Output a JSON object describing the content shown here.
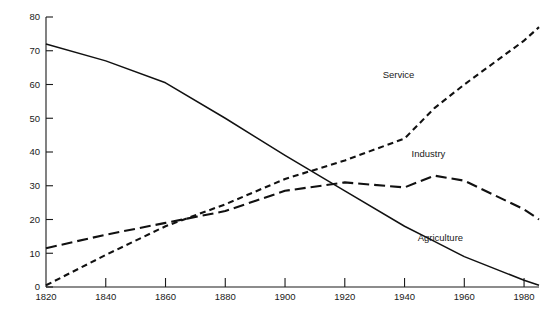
{
  "chart_data": {
    "type": "line",
    "title": "",
    "subtitle": "",
    "xlabel": "",
    "ylabel": "",
    "xlim": [
      1820,
      1985
    ],
    "ylim": [
      0,
      80
    ],
    "grid": false,
    "legend_position": "inline-annotations",
    "x_ticks": [
      "1820",
      "1840",
      "1860",
      "1880",
      "1900",
      "1920",
      "1940",
      "1960",
      "1980"
    ],
    "x_tick_values": [
      1820,
      1840,
      1860,
      1880,
      1900,
      1920,
      1940,
      1960,
      1980
    ],
    "y_ticks": [
      "0",
      "10",
      "20",
      "30",
      "40",
      "50",
      "60",
      "70",
      "80"
    ],
    "y_tick_values": [
      0,
      10,
      20,
      30,
      40,
      50,
      60,
      70,
      80
    ],
    "x": [
      1820,
      1840,
      1860,
      1880,
      1900,
      1920,
      1940,
      1950,
      1960,
      1980,
      1985
    ],
    "series": [
      {
        "name": "Agriculture",
        "style": "solid",
        "color": "#111111",
        "label_x": 1952,
        "label_y": 13.5,
        "values": [
          72,
          67,
          60.5,
          50,
          39,
          28.5,
          18,
          13.5,
          9,
          2,
          0.5
        ]
      },
      {
        "name": "Industry",
        "style": "long-dash",
        "color": "#111111",
        "label_x": 1948,
        "label_y": 38.5,
        "values": [
          11.5,
          15.5,
          19,
          22.5,
          28.5,
          31,
          29.5,
          33,
          31.5,
          23,
          20
        ]
      },
      {
        "name": "Service",
        "style": "short-dash",
        "color": "#111111",
        "label_x": 1938,
        "label_y": 62,
        "values": [
          0.5,
          9.5,
          18,
          24.5,
          32,
          37.5,
          44,
          53,
          60,
          73,
          77
        ]
      }
    ]
  }
}
